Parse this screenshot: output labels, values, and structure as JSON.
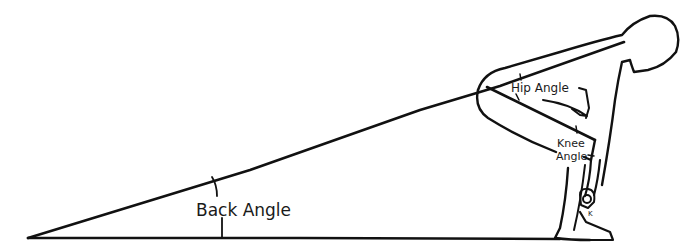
{
  "diagram": {
    "type": "biomechanics-figure",
    "labels": {
      "back_angle": "Back Angle",
      "hip_angle": "Hip Angle",
      "knee_angle_line1": "Knee",
      "knee_angle_line2": "Angle",
      "small_mark": "K"
    },
    "colors": {
      "ink": "#111111",
      "background": "#ffffff"
    }
  }
}
